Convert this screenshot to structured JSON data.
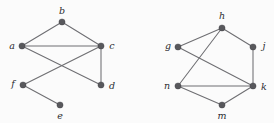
{
  "figure": {
    "type": "graph-diagram",
    "background_color": "#fbfbfb",
    "node_color": "#58585c",
    "edge_color": "#6e6e72",
    "label_color": "#2c2c30",
    "width": 274,
    "height": 123
  },
  "graphs": [
    {
      "id": "left-graph",
      "name": "graph-abcdef",
      "vertices": [
        {
          "id": "a",
          "label": "a",
          "x": 22,
          "y": 46,
          "label_x": 12,
          "label_y": 46,
          "anchor": "middle"
        },
        {
          "id": "b",
          "label": "b",
          "x": 62,
          "y": 22,
          "label_x": 62,
          "label_y": 11,
          "anchor": "middle"
        },
        {
          "id": "c",
          "label": "c",
          "x": 101,
          "y": 46,
          "label_x": 112,
          "label_y": 46,
          "anchor": "middle"
        },
        {
          "id": "d",
          "label": "d",
          "x": 101,
          "y": 85,
          "label_x": 112,
          "label_y": 86,
          "anchor": "middle"
        },
        {
          "id": "e",
          "label": "e",
          "x": 60,
          "y": 105,
          "label_x": 60,
          "label_y": 116,
          "anchor": "middle"
        },
        {
          "id": "f",
          "label": "f",
          "x": 23,
          "y": 85,
          "label_x": 13,
          "label_y": 84,
          "anchor": "middle"
        }
      ],
      "edges": [
        {
          "from": "a",
          "to": "b"
        },
        {
          "from": "b",
          "to": "c"
        },
        {
          "from": "a",
          "to": "c"
        },
        {
          "from": "a",
          "to": "d"
        },
        {
          "from": "c",
          "to": "d"
        },
        {
          "from": "c",
          "to": "f"
        },
        {
          "from": "f",
          "to": "e"
        }
      ]
    },
    {
      "id": "right-graph",
      "name": "graph-ghjkmn",
      "vertices": [
        {
          "id": "g",
          "label": "g",
          "x": 178,
          "y": 47,
          "label_x": 168,
          "label_y": 46,
          "anchor": "middle"
        },
        {
          "id": "h",
          "label": "h",
          "x": 222,
          "y": 28,
          "label_x": 222,
          "label_y": 16,
          "anchor": "middle"
        },
        {
          "id": "j",
          "label": "j",
          "x": 253,
          "y": 47,
          "label_x": 264,
          "label_y": 46,
          "anchor": "middle"
        },
        {
          "id": "k",
          "label": "k",
          "x": 253,
          "y": 86,
          "label_x": 264,
          "label_y": 87,
          "anchor": "middle"
        },
        {
          "id": "m",
          "label": "m",
          "x": 222,
          "y": 105,
          "label_x": 222,
          "label_y": 116,
          "anchor": "middle"
        },
        {
          "id": "n",
          "label": "n",
          "x": 178,
          "y": 86,
          "label_x": 167,
          "label_y": 86,
          "anchor": "middle"
        }
      ],
      "edges": [
        {
          "from": "g",
          "to": "h"
        },
        {
          "from": "h",
          "to": "j"
        },
        {
          "from": "h",
          "to": "n"
        },
        {
          "from": "g",
          "to": "k"
        },
        {
          "from": "j",
          "to": "k"
        },
        {
          "from": "n",
          "to": "k"
        },
        {
          "from": "n",
          "to": "m"
        },
        {
          "from": "m",
          "to": "k"
        }
      ]
    }
  ]
}
